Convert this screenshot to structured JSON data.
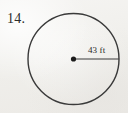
{
  "page": {
    "background_color": "#f2f1ee",
    "ink_color": "#2a2a2a",
    "width": 128,
    "height": 113
  },
  "problem": {
    "number_label": "14."
  },
  "figure": {
    "shape": "circle",
    "circle": {
      "center_x": 73.5,
      "center_y": 59,
      "radius_px": 45.5,
      "stroke_color": "#3a3a3a",
      "stroke_width": 1.4,
      "fill": "none"
    },
    "center_dot": {
      "name": "center-point",
      "x": 73.5,
      "y": 59,
      "radius_px": 2.6,
      "color": "#1b1b1b"
    },
    "radius_segment": {
      "from_x": 73.5,
      "from_y": 59,
      "to_x": 119,
      "to_y": 59,
      "stroke_color": "#3a3a3a",
      "stroke_width": 1.2
    },
    "radius_label": {
      "text": "43 ft",
      "value": 43,
      "unit": "ft"
    }
  }
}
